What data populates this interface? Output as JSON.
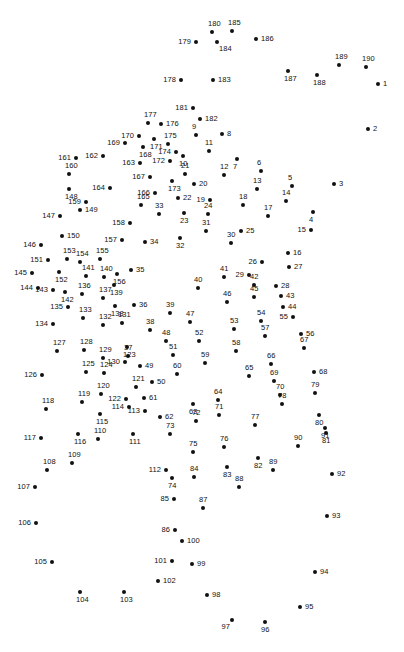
{
  "page": {
    "kind": "connect-the-dots-puzzle",
    "title": "",
    "background_color": "#ffffff",
    "dot_color": "#111111",
    "label_color": "#111111",
    "width": 404,
    "height": 652,
    "dot_count": 190,
    "number_range": "1-190"
  },
  "dots": [
    {
      "n": "1",
      "x": 378,
      "y": 84,
      "lp": "lp-r"
    },
    {
      "n": "2",
      "x": 368,
      "y": 129,
      "lp": "lp-r"
    },
    {
      "n": "3",
      "x": 334,
      "y": 184,
      "lp": "lp-r"
    },
    {
      "n": "4",
      "x": 313,
      "y": 212,
      "lp": "lp-b"
    },
    {
      "n": "5",
      "x": 292,
      "y": 186,
      "lp": "lp-t"
    },
    {
      "n": "6",
      "x": 261,
      "y": 171,
      "lp": "lp-t"
    },
    {
      "n": "7",
      "x": 237,
      "y": 159,
      "lp": "lp-b"
    },
    {
      "n": "8",
      "x": 222,
      "y": 134,
      "lp": "lp-r"
    },
    {
      "n": "9",
      "x": 196,
      "y": 135,
      "lp": "lp-t"
    },
    {
      "n": "10",
      "x": 183,
      "y": 156,
      "lp": "lp-b"
    },
    {
      "n": "11",
      "x": 209,
      "y": 151,
      "lp": "lp-t"
    },
    {
      "n": "12",
      "x": 224,
      "y": 175,
      "lp": "lp-t"
    },
    {
      "n": "13",
      "x": 257,
      "y": 189,
      "lp": "lp-t"
    },
    {
      "n": "14",
      "x": 286,
      "y": 201,
      "lp": "lp-t"
    },
    {
      "n": "15",
      "x": 311,
      "y": 230,
      "lp": "lp-l"
    },
    {
      "n": "16",
      "x": 288,
      "y": 253,
      "lp": "lp-r"
    },
    {
      "n": "17",
      "x": 268,
      "y": 216,
      "lp": "lp-t"
    },
    {
      "n": "18",
      "x": 243,
      "y": 205,
      "lp": "lp-t"
    },
    {
      "n": "19",
      "x": 210,
      "y": 200,
      "lp": "lp-l"
    },
    {
      "n": "20",
      "x": 194,
      "y": 184,
      "lp": "lp-r"
    },
    {
      "n": "21",
      "x": 185,
      "y": 174,
      "lp": "lp-t"
    },
    {
      "n": "22",
      "x": 178,
      "y": 198,
      "lp": "lp-r"
    },
    {
      "n": "23",
      "x": 184,
      "y": 213,
      "lp": "lp-b"
    },
    {
      "n": "24",
      "x": 208,
      "y": 214,
      "lp": "lp-t"
    },
    {
      "n": "25",
      "x": 241,
      "y": 231,
      "lp": "lp-r"
    },
    {
      "n": "26",
      "x": 262,
      "y": 262,
      "lp": "lp-l"
    },
    {
      "n": "27",
      "x": 289,
      "y": 267,
      "lp": "lp-r"
    },
    {
      "n": "28",
      "x": 276,
      "y": 286,
      "lp": "lp-r"
    },
    {
      "n": "29",
      "x": 249,
      "y": 275,
      "lp": "lp-l"
    },
    {
      "n": "30",
      "x": 231,
      "y": 243,
      "lp": "lp-t"
    },
    {
      "n": "31",
      "x": 206,
      "y": 231,
      "lp": "lp-t"
    },
    {
      "n": "32",
      "x": 180,
      "y": 238,
      "lp": "lp-b"
    },
    {
      "n": "33",
      "x": 159,
      "y": 214,
      "lp": "lp-t"
    },
    {
      "n": "34",
      "x": 145,
      "y": 242,
      "lp": "lp-r"
    },
    {
      "n": "35",
      "x": 131,
      "y": 270,
      "lp": "lp-r"
    },
    {
      "n": "36",
      "x": 134,
      "y": 305,
      "lp": "lp-r"
    },
    {
      "n": "37",
      "x": 128,
      "y": 356,
      "lp": "lp-t"
    },
    {
      "n": "38",
      "x": 150,
      "y": 330,
      "lp": "lp-t"
    },
    {
      "n": "39",
      "x": 170,
      "y": 313,
      "lp": "lp-t"
    },
    {
      "n": "40",
      "x": 198,
      "y": 288,
      "lp": "lp-t"
    },
    {
      "n": "41",
      "x": 224,
      "y": 277,
      "lp": "lp-t"
    },
    {
      "n": "42",
      "x": 254,
      "y": 285,
      "lp": "lp-t"
    },
    {
      "n": "43",
      "x": 281,
      "y": 296,
      "lp": "lp-r"
    },
    {
      "n": "44",
      "x": 283,
      "y": 307,
      "lp": "lp-r"
    },
    {
      "n": "45",
      "x": 254,
      "y": 297,
      "lp": "lp-t"
    },
    {
      "n": "46",
      "x": 227,
      "y": 302,
      "lp": "lp-t"
    },
    {
      "n": "47",
      "x": 190,
      "y": 322,
      "lp": "lp-t"
    },
    {
      "n": "48",
      "x": 166,
      "y": 341,
      "lp": "lp-t"
    },
    {
      "n": "49",
      "x": 140,
      "y": 366,
      "lp": "lp-r"
    },
    {
      "n": "50",
      "x": 152,
      "y": 382,
      "lp": "lp-r"
    },
    {
      "n": "51",
      "x": 173,
      "y": 355,
      "lp": "lp-t"
    },
    {
      "n": "52",
      "x": 199,
      "y": 341,
      "lp": "lp-t"
    },
    {
      "n": "53",
      "x": 234,
      "y": 329,
      "lp": "lp-t"
    },
    {
      "n": "54",
      "x": 261,
      "y": 321,
      "lp": "lp-t"
    },
    {
      "n": "55",
      "x": 293,
      "y": 317,
      "lp": "lp-l"
    },
    {
      "n": "56",
      "x": 301,
      "y": 334,
      "lp": "lp-r"
    },
    {
      "n": "57",
      "x": 265,
      "y": 336,
      "lp": "lp-t"
    },
    {
      "n": "58",
      "x": 236,
      "y": 351,
      "lp": "lp-t"
    },
    {
      "n": "59",
      "x": 205,
      "y": 363,
      "lp": "lp-t"
    },
    {
      "n": "60",
      "x": 177,
      "y": 374,
      "lp": "lp-t"
    },
    {
      "n": "61",
      "x": 144,
      "y": 398,
      "lp": "lp-r"
    },
    {
      "n": "62",
      "x": 160,
      "y": 417,
      "lp": "lp-r"
    },
    {
      "n": "63",
      "x": 193,
      "y": 404,
      "lp": "lp-b"
    },
    {
      "n": "64",
      "x": 218,
      "y": 400,
      "lp": "lp-t"
    },
    {
      "n": "65",
      "x": 249,
      "y": 376,
      "lp": "lp-t"
    },
    {
      "n": "66",
      "x": 271,
      "y": 364,
      "lp": "lp-t"
    },
    {
      "n": "67",
      "x": 304,
      "y": 348,
      "lp": "lp-t"
    },
    {
      "n": "68",
      "x": 314,
      "y": 372,
      "lp": "lp-r"
    },
    {
      "n": "69",
      "x": 274,
      "y": 381,
      "lp": "lp-t"
    },
    {
      "n": "70",
      "x": 280,
      "y": 395,
      "lp": "lp-t"
    },
    {
      "n": "71",
      "x": 219,
      "y": 415,
      "lp": "lp-t"
    },
    {
      "n": "72",
      "x": 196,
      "y": 421,
      "lp": "lp-t"
    },
    {
      "n": "73",
      "x": 170,
      "y": 434,
      "lp": "lp-t"
    },
    {
      "n": "74",
      "x": 172,
      "y": 478,
      "lp": "lp-b"
    },
    {
      "n": "75",
      "x": 193,
      "y": 452,
      "lp": "lp-t"
    },
    {
      "n": "76",
      "x": 224,
      "y": 447,
      "lp": "lp-t"
    },
    {
      "n": "77",
      "x": 255,
      "y": 425,
      "lp": "lp-t"
    },
    {
      "n": "78",
      "x": 282,
      "y": 404,
      "lp": "lp-t"
    },
    {
      "n": "79",
      "x": 315,
      "y": 393,
      "lp": "lp-t"
    },
    {
      "n": "80",
      "x": 319,
      "y": 415,
      "lp": "lp-b"
    },
    {
      "n": "81",
      "x": 326,
      "y": 433,
      "lp": "lp-b"
    },
    {
      "n": "82",
      "x": 258,
      "y": 458,
      "lp": "lp-b"
    },
    {
      "n": "83",
      "x": 227,
      "y": 467,
      "lp": "lp-b"
    },
    {
      "n": "84",
      "x": 194,
      "y": 477,
      "lp": "lp-t"
    },
    {
      "n": "85",
      "x": 174,
      "y": 499,
      "lp": "lp-l"
    },
    {
      "n": "86",
      "x": 175,
      "y": 530,
      "lp": "lp-l"
    },
    {
      "n": "87",
      "x": 203,
      "y": 508,
      "lp": "lp-t"
    },
    {
      "n": "88",
      "x": 239,
      "y": 487,
      "lp": "lp-t"
    },
    {
      "n": "89",
      "x": 273,
      "y": 470,
      "lp": "lp-t"
    },
    {
      "n": "90",
      "x": 298,
      "y": 446,
      "lp": "lp-t"
    },
    {
      "n": "91",
      "x": 325,
      "y": 428,
      "lp": "lp-b"
    },
    {
      "n": "92",
      "x": 332,
      "y": 474,
      "lp": "lp-r"
    },
    {
      "n": "93",
      "x": 327,
      "y": 516,
      "lp": "lp-r"
    },
    {
      "n": "94",
      "x": 315,
      "y": 572,
      "lp": "lp-r"
    },
    {
      "n": "95",
      "x": 300,
      "y": 607,
      "lp": "lp-r"
    },
    {
      "n": "96",
      "x": 265,
      "y": 622,
      "lp": "lp-b"
    },
    {
      "n": "97",
      "x": 232,
      "y": 620,
      "lp": "lp-bl"
    },
    {
      "n": "98",
      "x": 207,
      "y": 595,
      "lp": "lp-r"
    },
    {
      "n": "99",
      "x": 192,
      "y": 564,
      "lp": "lp-r"
    },
    {
      "n": "100",
      "x": 182,
      "y": 541,
      "lp": "lp-r"
    },
    {
      "n": "101",
      "x": 172,
      "y": 561,
      "lp": "lp-l"
    },
    {
      "n": "102",
      "x": 158,
      "y": 581,
      "lp": "lp-r"
    },
    {
      "n": "103",
      "x": 124,
      "y": 592,
      "lp": "lp-b"
    },
    {
      "n": "104",
      "x": 80,
      "y": 592,
      "lp": "lp-b"
    },
    {
      "n": "105",
      "x": 52,
      "y": 562,
      "lp": "lp-l"
    },
    {
      "n": "106",
      "x": 36,
      "y": 523,
      "lp": "lp-l"
    },
    {
      "n": "107",
      "x": 35,
      "y": 487,
      "lp": "lp-l"
    },
    {
      "n": "108",
      "x": 47,
      "y": 470,
      "lp": "lp-t"
    },
    {
      "n": "109",
      "x": 72,
      "y": 463,
      "lp": "lp-t"
    },
    {
      "n": "110",
      "x": 98,
      "y": 439,
      "lp": "lp-t"
    },
    {
      "n": "111",
      "x": 133,
      "y": 434,
      "lp": "lp-b"
    },
    {
      "n": "112",
      "x": 166,
      "y": 470,
      "lp": "lp-l"
    },
    {
      "n": "113",
      "x": 145,
      "y": 411,
      "lp": "lp-l"
    },
    {
      "n": "114",
      "x": 129,
      "y": 407,
      "lp": "lp-l"
    },
    {
      "n": "115",
      "x": 100,
      "y": 414,
      "lp": "lp-b"
    },
    {
      "n": "116",
      "x": 78,
      "y": 434,
      "lp": "lp-b"
    },
    {
      "n": "117",
      "x": 41,
      "y": 438,
      "lp": "lp-l"
    },
    {
      "n": "118",
      "x": 46,
      "y": 409,
      "lp": "lp-t"
    },
    {
      "n": "119",
      "x": 82,
      "y": 402,
      "lp": "lp-t"
    },
    {
      "n": "120",
      "x": 101,
      "y": 394,
      "lp": "lp-t"
    },
    {
      "n": "121",
      "x": 136,
      "y": 387,
      "lp": "lp-t"
    },
    {
      "n": "122",
      "x": 126,
      "y": 399,
      "lp": "lp-l"
    },
    {
      "n": "123",
      "x": 127,
      "y": 347,
      "lp": "lp-b"
    },
    {
      "n": "124",
      "x": 104,
      "y": 373,
      "lp": "lp-t"
    },
    {
      "n": "125",
      "x": 86,
      "y": 372,
      "lp": "lp-t"
    },
    {
      "n": "126",
      "x": 42,
      "y": 375,
      "lp": "lp-l"
    },
    {
      "n": "127",
      "x": 57,
      "y": 351,
      "lp": "lp-t"
    },
    {
      "n": "128",
      "x": 84,
      "y": 350,
      "lp": "lp-t"
    },
    {
      "n": "129",
      "x": 103,
      "y": 358,
      "lp": "lp-t"
    },
    {
      "n": "130",
      "x": 125,
      "y": 362,
      "lp": "lp-l"
    },
    {
      "n": "131",
      "x": 122,
      "y": 323,
      "lp": "lp-t"
    },
    {
      "n": "132",
      "x": 103,
      "y": 325,
      "lp": "lp-t"
    },
    {
      "n": "133",
      "x": 83,
      "y": 318,
      "lp": "lp-t"
    },
    {
      "n": "134",
      "x": 53,
      "y": 324,
      "lp": "lp-l"
    },
    {
      "n": "135",
      "x": 68,
      "y": 307,
      "lp": "lp-l"
    },
    {
      "n": "136",
      "x": 82,
      "y": 294,
      "lp": "lp-t"
    },
    {
      "n": "137",
      "x": 103,
      "y": 298,
      "lp": "lp-t"
    },
    {
      "n": "138",
      "x": 115,
      "y": 306,
      "lp": "lp-b"
    },
    {
      "n": "139",
      "x": 114,
      "y": 285,
      "lp": "lp-b"
    },
    {
      "n": "140",
      "x": 104,
      "y": 277,
      "lp": "lp-t"
    },
    {
      "n": "141",
      "x": 86,
      "y": 276,
      "lp": "lp-t"
    },
    {
      "n": "142",
      "x": 65,
      "y": 292,
      "lp": "lp-b"
    },
    {
      "n": "143",
      "x": 53,
      "y": 290,
      "lp": "lp-l"
    },
    {
      "n": "144",
      "x": 38,
      "y": 288,
      "lp": "lp-l"
    },
    {
      "n": "145",
      "x": 32,
      "y": 273,
      "lp": "lp-l"
    },
    {
      "n": "146",
      "x": 41,
      "y": 245,
      "lp": "lp-l"
    },
    {
      "n": "147",
      "x": 60,
      "y": 216,
      "lp": "lp-l"
    },
    {
      "n": "148",
      "x": 69,
      "y": 189,
      "lp": "lp-b"
    },
    {
      "n": "149",
      "x": 80,
      "y": 210,
      "lp": "lp-r"
    },
    {
      "n": "150",
      "x": 62,
      "y": 236,
      "lp": "lp-r"
    },
    {
      "n": "151",
      "x": 48,
      "y": 260,
      "lp": "lp-l"
    },
    {
      "n": "152",
      "x": 59,
      "y": 272,
      "lp": "lp-b"
    },
    {
      "n": "153",
      "x": 67,
      "y": 259,
      "lp": "lp-t"
    },
    {
      "n": "154",
      "x": 80,
      "y": 262,
      "lp": "lp-t"
    },
    {
      "n": "155",
      "x": 100,
      "y": 259,
      "lp": "lp-t"
    },
    {
      "n": "156",
      "x": 117,
      "y": 274,
      "lp": "lp-b"
    },
    {
      "n": "157",
      "x": 122,
      "y": 240,
      "lp": "lp-l"
    },
    {
      "n": "158",
      "x": 130,
      "y": 223,
      "lp": "lp-l"
    },
    {
      "n": "159",
      "x": 86,
      "y": 202,
      "lp": "lp-l"
    },
    {
      "n": "160",
      "x": 69,
      "y": 174,
      "lp": "lp-t"
    },
    {
      "n": "161",
      "x": 76,
      "y": 158,
      "lp": "lp-l"
    },
    {
      "n": "162",
      "x": 103,
      "y": 156,
      "lp": "lp-l"
    },
    {
      "n": "163",
      "x": 140,
      "y": 163,
      "lp": "lp-l"
    },
    {
      "n": "164",
      "x": 110,
      "y": 188,
      "lp": "lp-l"
    },
    {
      "n": "165",
      "x": 141,
      "y": 205,
      "lp": "lp-t"
    },
    {
      "n": "166",
      "x": 155,
      "y": 193,
      "lp": "lp-l"
    },
    {
      "n": "167",
      "x": 150,
      "y": 177,
      "lp": "lp-l"
    },
    {
      "n": "168",
      "x": 143,
      "y": 147,
      "lp": "lp-b"
    },
    {
      "n": "169",
      "x": 125,
      "y": 143,
      "lp": "lp-l"
    },
    {
      "n": "170",
      "x": 139,
      "y": 136,
      "lp": "lp-l"
    },
    {
      "n": "171",
      "x": 154,
      "y": 139,
      "lp": "lp-b"
    },
    {
      "n": "172",
      "x": 170,
      "y": 161,
      "lp": "lp-l"
    },
    {
      "n": "173",
      "x": 172,
      "y": 181,
      "lp": "lp-b"
    },
    {
      "n": "174",
      "x": 176,
      "y": 152,
      "lp": "lp-l"
    },
    {
      "n": "175",
      "x": 168,
      "y": 144,
      "lp": "lp-t"
    },
    {
      "n": "176",
      "x": 161,
      "y": 124,
      "lp": "lp-r"
    },
    {
      "n": "177",
      "x": 148,
      "y": 123,
      "lp": "lp-t"
    },
    {
      "n": "178",
      "x": 181,
      "y": 80,
      "lp": "lp-l"
    },
    {
      "n": "179",
      "x": 196,
      "y": 42,
      "lp": "lp-l"
    },
    {
      "n": "180",
      "x": 212,
      "y": 32,
      "lp": "lp-t"
    },
    {
      "n": "181",
      "x": 193,
      "y": 108,
      "lp": "lp-l"
    },
    {
      "n": "182",
      "x": 200,
      "y": 119,
      "lp": "lp-r"
    },
    {
      "n": "183",
      "x": 213,
      "y": 80,
      "lp": "lp-r"
    },
    {
      "n": "184",
      "x": 217,
      "y": 42,
      "lp": "lp-br"
    },
    {
      "n": "185",
      "x": 232,
      "y": 31,
      "lp": "lp-t"
    },
    {
      "n": "186",
      "x": 256,
      "y": 39,
      "lp": "lp-r"
    },
    {
      "n": "187",
      "x": 288,
      "y": 71,
      "lp": "lp-b"
    },
    {
      "n": "188",
      "x": 317,
      "y": 75,
      "lp": "lp-b"
    },
    {
      "n": "189",
      "x": 339,
      "y": 65,
      "lp": "lp-t"
    },
    {
      "n": "190",
      "x": 366,
      "y": 67,
      "lp": "lp-t"
    }
  ]
}
